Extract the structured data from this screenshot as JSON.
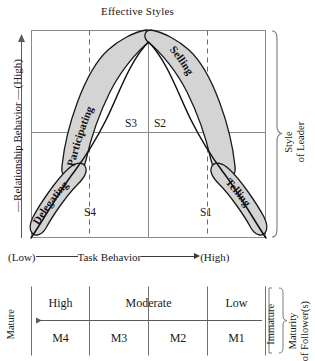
{
  "figure": {
    "title": "Effective Styles",
    "y_axis": {
      "label": "Relationship Behavior",
      "high_marker": "(High)",
      "full": "—Relationship Behavior —(High)"
    },
    "x_axis": {
      "low_marker": "(Low)",
      "label": "Task Behavior",
      "high_marker": "(High)"
    },
    "right_bracket": {
      "line1": "Style",
      "line2": "of Leader"
    }
  },
  "curve_labels": [
    {
      "id": "delegating",
      "text": "Delegating"
    },
    {
      "id": "participating",
      "text": "Participating"
    },
    {
      "id": "selling",
      "text": "Selling"
    },
    {
      "id": "telling",
      "text": "Telling"
    }
  ],
  "quadrants": [
    {
      "id": "s3",
      "text": "S3"
    },
    {
      "id": "s2",
      "text": "S2"
    },
    {
      "id": "s4",
      "text": "S4"
    },
    {
      "id": "s1",
      "text": "S1"
    }
  ],
  "maturity_table": {
    "left_end_label": "Mature",
    "right_end_label": "Immature",
    "bracket": {
      "line1": "Maturity",
      "line2": "of Follower(s)"
    },
    "top_row": [
      {
        "label": "High",
        "span": 1
      },
      {
        "label": "Moderate",
        "span": 2
      },
      {
        "label": "Low",
        "span": 1
      }
    ],
    "bottom_row": [
      "M4",
      "M3",
      "M2",
      "M1"
    ]
  },
  "colors": {
    "blob_fill": "#d4d4d4",
    "blob_stroke": "#1a1a1a",
    "axis": "#5a5a5a",
    "text": "#1a1a1a",
    "background": "#ffffff"
  }
}
